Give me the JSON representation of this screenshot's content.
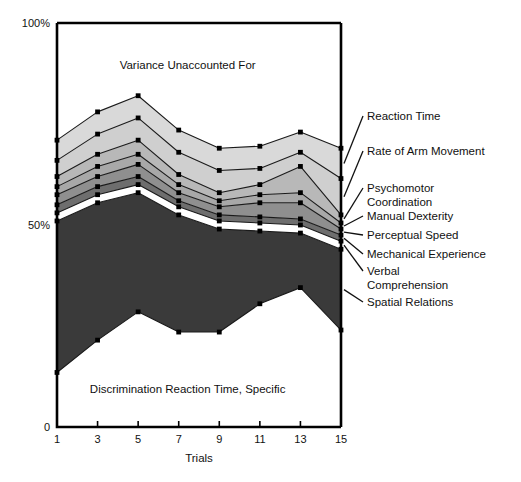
{
  "chart_data": {
    "type": "area",
    "title": "",
    "xlabel": "Trials",
    "ylabel": "",
    "x": [
      1,
      3,
      5,
      7,
      9,
      11,
      13,
      15
    ],
    "xticks": [
      "1",
      "3",
      "5",
      "7",
      "9",
      "11",
      "13",
      "15"
    ],
    "xlim": [
      1,
      15
    ],
    "ylim": [
      0,
      100
    ],
    "yticks": [
      "0",
      "50%",
      "100%"
    ],
    "ytick_values": [
      0,
      50,
      100
    ],
    "grid": false,
    "legend_position": "right-inline-leaders",
    "stacking": "bottom-up",
    "note": "Stacked area of percent variance. Bands listed bottom-to-top; each band's values are its share of the 100% total. Top residual region is unlabeled 'Variance Unaccounted For'.",
    "series": [
      {
        "name": "Discrimination Reaction Time, Specific",
        "color": "#ffffff",
        "label_placement": "inside-bottom",
        "values": [
          13.5,
          21.5,
          28.5,
          23.5,
          23.5,
          30.5,
          34.5,
          24.0
        ],
        "cum_top": [
          13.5,
          21.5,
          28.5,
          23.5,
          23.5,
          30.5,
          34.5,
          24.0
        ]
      },
      {
        "name": "Spatial Relations",
        "color": "#3a3a3a",
        "values": [
          37.5,
          34.0,
          29.5,
          29.0,
          25.5,
          18.0,
          13.5,
          20.0
        ],
        "cum_top": [
          51.0,
          55.5,
          58.0,
          52.5,
          49.0,
          48.5,
          48.0,
          44.0
        ]
      },
      {
        "name": "Verbal Comprehension",
        "color": "#ffffff",
        "values": [
          2.0,
          2.0,
          2.0,
          2.0,
          2.0,
          2.0,
          2.0,
          2.0
        ],
        "cum_top": [
          53.0,
          57.5,
          60.0,
          54.5,
          51.0,
          50.5,
          50.0,
          46.0
        ]
      },
      {
        "name": "Mechanical Experience",
        "color": "#6e6e6e",
        "values": [
          2.0,
          2.0,
          2.0,
          1.5,
          1.5,
          1.5,
          1.5,
          1.5
        ],
        "cum_top": [
          55.0,
          59.5,
          62.0,
          56.0,
          52.5,
          52.0,
          51.5,
          47.5
        ]
      },
      {
        "name": "Perceptual Speed",
        "color": "#8f8f8f",
        "values": [
          2.5,
          2.5,
          3.0,
          2.0,
          2.0,
          3.5,
          4.0,
          1.5
        ],
        "cum_top": [
          57.5,
          62.0,
          65.0,
          58.0,
          54.5,
          55.5,
          55.5,
          49.0
        ]
      },
      {
        "name": "Manual Dexterity",
        "color": "#a8a8a8",
        "values": [
          2.0,
          2.5,
          2.5,
          2.0,
          1.5,
          2.0,
          2.5,
          1.5
        ],
        "cum_top": [
          59.5,
          64.5,
          67.5,
          60.0,
          56.0,
          57.5,
          58.0,
          50.5
        ]
      },
      {
        "name": "Psychomotor Coordination",
        "color": "#b8b8b8",
        "values": [
          2.5,
          3.0,
          3.5,
          2.5,
          2.0,
          2.5,
          6.5,
          2.0
        ],
        "cum_top": [
          62.0,
          67.5,
          71.0,
          62.5,
          58.0,
          60.0,
          64.5,
          52.5
        ]
      },
      {
        "name": "Rate of Arm Movement",
        "color": "#cfcfcf",
        "values": [
          4.0,
          5.0,
          5.5,
          5.5,
          5.5,
          4.0,
          3.5,
          9.0
        ],
        "cum_top": [
          66.0,
          72.5,
          76.5,
          68.0,
          63.5,
          64.0,
          68.0,
          61.5
        ]
      },
      {
        "name": "Reaction Time",
        "color": "#d9d9d9",
        "values": [
          5.0,
          5.5,
          5.5,
          5.5,
          5.5,
          5.5,
          5.0,
          7.5
        ],
        "cum_top": [
          71.0,
          78.0,
          82.0,
          73.5,
          69.0,
          69.5,
          73.0,
          69.0
        ]
      }
    ],
    "annotations": [
      {
        "text": "Variance Unaccounted For",
        "x_pct": 0.46,
        "y_pct": 0.885
      },
      {
        "text": "Discrimination Reaction Time, Specific",
        "x_pct": 0.46,
        "y_pct": 0.085
      }
    ],
    "leader_labels": [
      {
        "text": "Reaction Time",
        "lines": [
          "Reaction Time"
        ]
      },
      {
        "text": "Rate of Arm Movement",
        "lines": [
          "Rate of Arm Movement"
        ]
      },
      {
        "text": "Psychomotor Coordination",
        "lines": [
          "Psychomotor",
          "Coordination"
        ]
      },
      {
        "text": "Manual Dexterity",
        "lines": [
          "Manual Dexterity"
        ]
      },
      {
        "text": "Perceptual Speed",
        "lines": [
          "Perceptual Speed"
        ]
      },
      {
        "text": "Mechanical Experience",
        "lines": [
          "Mechanical Experience"
        ]
      },
      {
        "text": "Verbal Comprehension",
        "lines": [
          "Verbal",
          "Comprehension"
        ]
      },
      {
        "text": "Spatial Relations",
        "lines": [
          "Spatial Relations"
        ]
      }
    ]
  },
  "figure": {
    "caption": "",
    "axis_color": "#000000",
    "marker_color": "#000000",
    "line_color": "#1a1a1a"
  }
}
